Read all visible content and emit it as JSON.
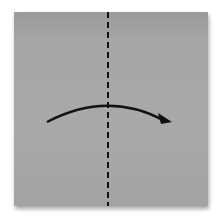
{
  "diagram": {
    "type": "origami-fold-step",
    "paper": {
      "color": "#a8a8a8",
      "shape": "square"
    },
    "fold_line": {
      "style": "dashed",
      "orientation": "vertical",
      "position": "center",
      "color": "#111111"
    },
    "arrow": {
      "direction": "left-to-right",
      "shape": "curved",
      "color": "#111111"
    }
  }
}
